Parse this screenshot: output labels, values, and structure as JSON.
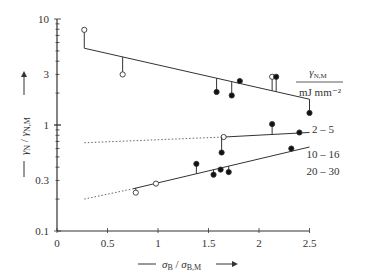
{
  "chart_data": {
    "type": "scatter",
    "title": "",
    "xlabel": "σB / σB,M",
    "ylabel": "γN / γN,M",
    "xscale": "linear",
    "yscale": "log",
    "xlim": [
      0,
      2.5
    ],
    "ylim": [
      0.1,
      10
    ],
    "x_ticks": [
      "0",
      "0.5",
      "1",
      "1.5",
      "2",
      "2.5"
    ],
    "y_ticks": [
      "0.1",
      "0.3",
      "1",
      "3",
      "10"
    ],
    "grid": false,
    "legend_title": "γN,M / mJ mm⁻²",
    "legend_title_top": "γN,M",
    "legend_title_bottom": "mJ mm⁻²",
    "series": [
      {
        "name": "2 – 5",
        "fit_line": {
          "x": [
            0.27,
            2.5
          ],
          "y": [
            5.3,
            1.75
          ],
          "style": "solid"
        },
        "open_points": [
          {
            "x": 0.27,
            "y": 7.9
          },
          {
            "x": 0.65,
            "y": 3.0
          },
          {
            "x": 2.13,
            "y": 2.85
          }
        ],
        "filled_points": [
          {
            "x": 1.58,
            "y": 2.05
          },
          {
            "x": 1.73,
            "y": 1.9
          },
          {
            "x": 1.81,
            "y": 2.6
          },
          {
            "x": 2.17,
            "y": 2.85
          },
          {
            "x": 2.5,
            "y": 1.3
          }
        ]
      },
      {
        "name": "10 – 16",
        "fit_line_dotted": {
          "x": [
            0.27,
            1.65
          ],
          "y": [
            0.68,
            0.77
          ],
          "style": "dotted"
        },
        "fit_line": {
          "x": [
            1.65,
            2.5
          ],
          "y": [
            0.77,
            0.85
          ],
          "style": "solid"
        },
        "open_points": [
          {
            "x": 1.65,
            "y": 0.77
          }
        ],
        "filled_points": [
          {
            "x": 1.63,
            "y": 0.55
          },
          {
            "x": 2.13,
            "y": 1.02
          },
          {
            "x": 2.4,
            "y": 0.85
          }
        ]
      },
      {
        "name": "20 – 30",
        "fit_line_dotted": {
          "x": [
            0.27,
            0.75
          ],
          "y": [
            0.2,
            0.25
          ],
          "style": "dotted"
        },
        "fit_line": {
          "x": [
            0.75,
            2.5
          ],
          "y": [
            0.25,
            0.62
          ],
          "style": "solid"
        },
        "open_points": [
          {
            "x": 0.78,
            "y": 0.23
          },
          {
            "x": 0.98,
            "y": 0.28
          }
        ],
        "filled_points": [
          {
            "x": 1.38,
            "y": 0.43
          },
          {
            "x": 1.55,
            "y": 0.34
          },
          {
            "x": 1.62,
            "y": 0.38
          },
          {
            "x": 1.7,
            "y": 0.36
          },
          {
            "x": 2.32,
            "y": 0.6
          }
        ]
      }
    ],
    "legend_labels": [
      "2 – 5",
      "10 – 16",
      "20 – 30"
    ]
  }
}
